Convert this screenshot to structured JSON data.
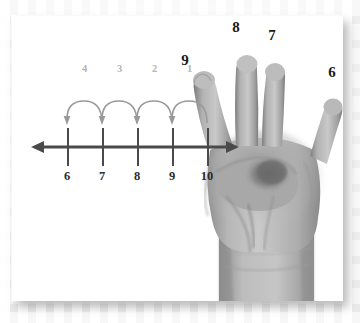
{
  "scene": {
    "kind": "math-worksheet-illustration",
    "description": "Counting back on a number line from 10 with a hand showing four fingers",
    "card_background": "#ffffff",
    "page_background": "#f4f4f4"
  },
  "number_line": {
    "name": "counting-back-number-line",
    "axis_color": "#4a4a4a",
    "tick_label_color": "#2b2b2b",
    "arc_color": "#9a9a9a",
    "arc_label_color": "#b4b4b4",
    "direction": "backwards",
    "ticks": [
      {
        "label": "6",
        "x": 38
      },
      {
        "label": "7",
        "x": 73
      },
      {
        "label": "8",
        "x": 108
      },
      {
        "label": "9",
        "x": 143
      },
      {
        "label": "10",
        "x": 178
      }
    ],
    "jumps": [
      {
        "label": "4",
        "from": "7",
        "to": "6",
        "x": 55.5
      },
      {
        "label": "3",
        "from": "8",
        "to": "7",
        "x": 90.5
      },
      {
        "label": "2",
        "from": "9",
        "to": "8",
        "x": 125.5
      },
      {
        "label": "1",
        "from": "10",
        "to": "9",
        "x": 160.5
      }
    ]
  },
  "hand": {
    "name": "hand-showing-four-fingers",
    "finger_count": 4,
    "skin_color": "#b3b3b3",
    "labels": [
      {
        "value": "9",
        "finger": "index",
        "x": 185,
        "y": 60
      },
      {
        "value": "8",
        "finger": "middle",
        "x": 236,
        "y": 27
      },
      {
        "value": "7",
        "finger": "ring",
        "x": 272,
        "y": 35
      },
      {
        "value": "6",
        "finger": "pinky",
        "x": 332,
        "y": 72
      }
    ]
  }
}
